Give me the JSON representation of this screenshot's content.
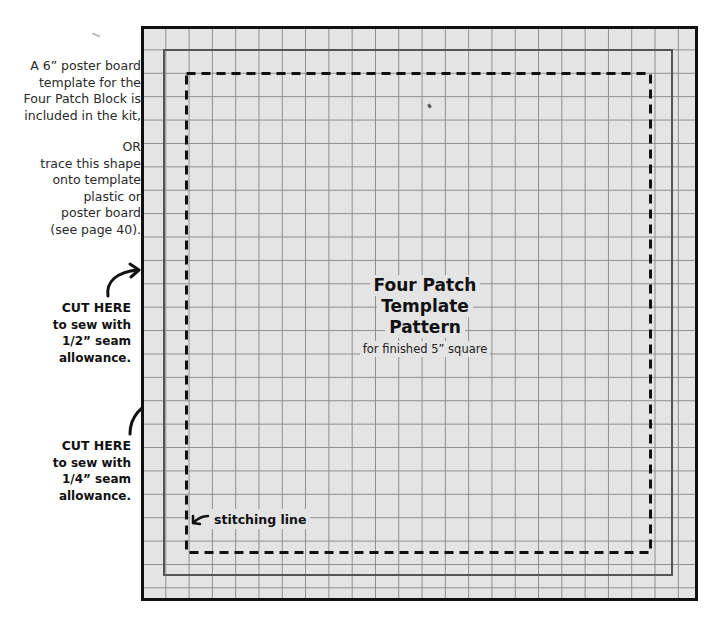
{
  "page": {
    "side_notes": {
      "kit_note": [
        "A 6” poster board",
        "template for the",
        "Four Patch Block is",
        "included in the kit,"
      ],
      "trace_note": [
        "OR",
        "trace this shape",
        "onto template",
        "plastic or",
        "poster board",
        "(see page 40)."
      ]
    },
    "cut_labels": [
      {
        "heading": "CUT HERE",
        "lines": [
          "to sew with",
          "1/2” seam",
          "allowance."
        ],
        "arrow_icon": "curved-arrow-right-icon"
      },
      {
        "heading": "CUT HERE",
        "lines": [
          "to sew with",
          "1/4” seam",
          "allowance."
        ],
        "arrow_icon": "curved-arrow-right-icon"
      }
    ],
    "template": {
      "title_lines": [
        "Four Patch",
        "Template",
        "Pattern"
      ],
      "subtitle": "for finished 5” square",
      "stitch_label": "stitching line",
      "stitch_arrow_icon": "arrow-left-icon",
      "grid": {
        "columns": 24,
        "rows": 25,
        "line_color": "#8d8d8d",
        "fill_color": "#e4e4e4"
      },
      "outer_border_color": "#111111",
      "inner_line_color": "#555555",
      "stitch_line_style": "dashed"
    }
  }
}
